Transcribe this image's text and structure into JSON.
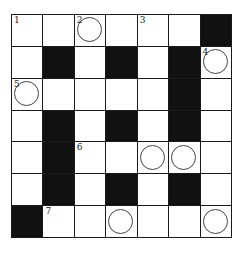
{
  "puzzle": {
    "rows": 7,
    "cols": 7,
    "colors": {
      "black": "#111111",
      "white": "#ffffff",
      "line": "#1a1a1a",
      "circle": "#444444"
    },
    "grid": [
      [
        {
          "b": 0,
          "n": "1",
          "c": 0
        },
        {
          "b": 0,
          "n": "",
          "c": 0
        },
        {
          "b": 0,
          "n": "2",
          "c": 1
        },
        {
          "b": 0,
          "n": "",
          "c": 0
        },
        {
          "b": 0,
          "n": "3",
          "c": 0
        },
        {
          "b": 0,
          "n": "",
          "c": 0
        },
        {
          "b": 1,
          "n": "",
          "c": 0
        }
      ],
      [
        {
          "b": 0,
          "n": "",
          "c": 0
        },
        {
          "b": 1,
          "n": "",
          "c": 0
        },
        {
          "b": 0,
          "n": "",
          "c": 0
        },
        {
          "b": 1,
          "n": "",
          "c": 0
        },
        {
          "b": 0,
          "n": "",
          "c": 0
        },
        {
          "b": 1,
          "n": "",
          "c": 0
        },
        {
          "b": 0,
          "n": "4",
          "c": 1
        }
      ],
      [
        {
          "b": 0,
          "n": "5",
          "c": 1
        },
        {
          "b": 0,
          "n": "",
          "c": 0
        },
        {
          "b": 0,
          "n": "",
          "c": 0
        },
        {
          "b": 0,
          "n": "",
          "c": 0
        },
        {
          "b": 0,
          "n": "",
          "c": 0
        },
        {
          "b": 1,
          "n": "",
          "c": 0
        },
        {
          "b": 0,
          "n": "",
          "c": 0
        }
      ],
      [
        {
          "b": 0,
          "n": "",
          "c": 0
        },
        {
          "b": 1,
          "n": "",
          "c": 0
        },
        {
          "b": 0,
          "n": "",
          "c": 0
        },
        {
          "b": 1,
          "n": "",
          "c": 0
        },
        {
          "b": 0,
          "n": "",
          "c": 0
        },
        {
          "b": 1,
          "n": "",
          "c": 0
        },
        {
          "b": 0,
          "n": "",
          "c": 0
        }
      ],
      [
        {
          "b": 0,
          "n": "",
          "c": 0
        },
        {
          "b": 1,
          "n": "",
          "c": 0
        },
        {
          "b": 0,
          "n": "6",
          "c": 0
        },
        {
          "b": 0,
          "n": "",
          "c": 0
        },
        {
          "b": 0,
          "n": "",
          "c": 1
        },
        {
          "b": 0,
          "n": "",
          "c": 1
        },
        {
          "b": 0,
          "n": "",
          "c": 0
        }
      ],
      [
        {
          "b": 0,
          "n": "",
          "c": 0
        },
        {
          "b": 1,
          "n": "",
          "c": 0
        },
        {
          "b": 0,
          "n": "",
          "c": 0
        },
        {
          "b": 1,
          "n": "",
          "c": 0
        },
        {
          "b": 0,
          "n": "",
          "c": 0
        },
        {
          "b": 1,
          "n": "",
          "c": 0
        },
        {
          "b": 0,
          "n": "",
          "c": 0
        }
      ],
      [
        {
          "b": 1,
          "n": "",
          "c": 0
        },
        {
          "b": 0,
          "n": "7",
          "c": 0
        },
        {
          "b": 0,
          "n": "",
          "c": 0
        },
        {
          "b": 0,
          "n": "",
          "c": 1
        },
        {
          "b": 0,
          "n": "",
          "c": 0
        },
        {
          "b": 0,
          "n": "",
          "c": 0
        },
        {
          "b": 0,
          "n": "",
          "c": 1
        }
      ]
    ]
  }
}
